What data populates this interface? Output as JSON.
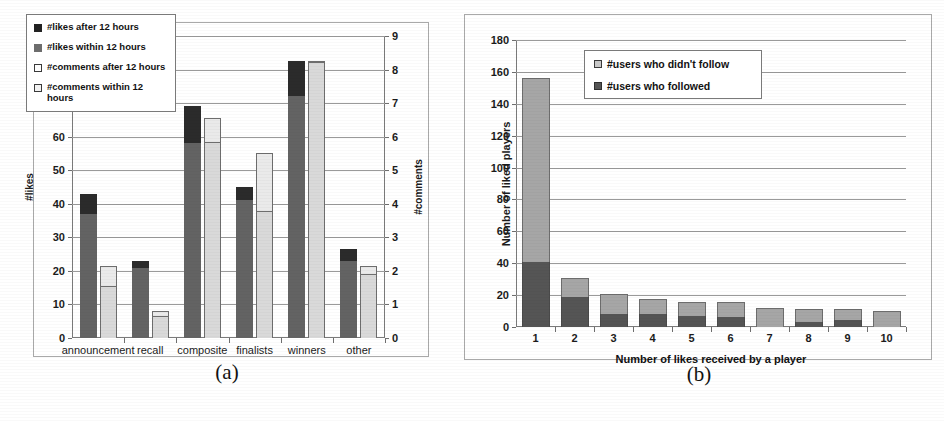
{
  "figure": {
    "caption_a": "(a)",
    "caption_b": "(b)"
  },
  "chart_data": [
    {
      "type": "bar",
      "panel": "a",
      "title": "",
      "xlabel": "",
      "ylabel": "#likes",
      "ylabel_secondary": "#comments",
      "ylim": [
        0,
        90
      ],
      "ylim_secondary": [
        0,
        9
      ],
      "yticks": [
        0,
        10,
        20,
        30,
        40,
        50,
        60,
        70,
        80,
        90
      ],
      "yticks_secondary": [
        0,
        1,
        2,
        3,
        4,
        5,
        6,
        7,
        8,
        9
      ],
      "grid": true,
      "legend_position": "upper-left",
      "stacked": true,
      "categories": [
        "announcement",
        "recall",
        "composite",
        "finalists",
        "winners",
        "other"
      ],
      "series": [
        {
          "name": "#likes within 12 hours",
          "axis": "left",
          "color": "#636363",
          "values": [
            37,
            21,
            58,
            41,
            72,
            23
          ]
        },
        {
          "name": "#likes after 12 hours",
          "axis": "left",
          "color": "#2b2b2b",
          "values": [
            6,
            2,
            11,
            4,
            10.5,
            3.5
          ]
        },
        {
          "name": "#comments within 12 hours",
          "axis": "right",
          "color": "#d9d9d9",
          "values": [
            1.55,
            0.65,
            5.85,
            3.8,
            8.25,
            1.9
          ]
        },
        {
          "name": "#comments after 12 hours",
          "axis": "right",
          "color": "#eaeaea",
          "values": [
            0.6,
            0.15,
            0.7,
            1.7,
            0.0,
            0.25
          ]
        }
      ],
      "legend_entries": [
        "#likes after 12 hours",
        "#likes within 12 hours",
        "#comments after 12 hours",
        "#comments within 12 hours"
      ]
    },
    {
      "type": "bar",
      "panel": "b",
      "title": "",
      "xlabel": "Number of likes received by a player",
      "ylabel": "Number of liked players",
      "ylim": [
        0,
        180
      ],
      "yticks": [
        0,
        20,
        40,
        60,
        80,
        100,
        120,
        140,
        160,
        180
      ],
      "grid": true,
      "legend_position": "upper-center",
      "stacked": true,
      "categories": [
        "1",
        "2",
        "3",
        "4",
        "5",
        "6",
        "7",
        "8",
        "9",
        "10"
      ],
      "series": [
        {
          "name": "#users who followed",
          "color": "#555555",
          "values": [
            41,
            19,
            8,
            8,
            7,
            6,
            0,
            3,
            4.5,
            0
          ]
        },
        {
          "name": "#users who didn't follow",
          "color": "#a6a6a6",
          "values": [
            115,
            12,
            13,
            9.5,
            8.5,
            10,
            12,
            8,
            6.5,
            10
          ]
        }
      ],
      "totals": [
        156,
        31,
        21,
        17.5,
        15.5,
        16,
        12,
        11,
        11,
        10
      ],
      "legend_entries": [
        "#users who didn't follow",
        "#users who followed"
      ]
    }
  ]
}
